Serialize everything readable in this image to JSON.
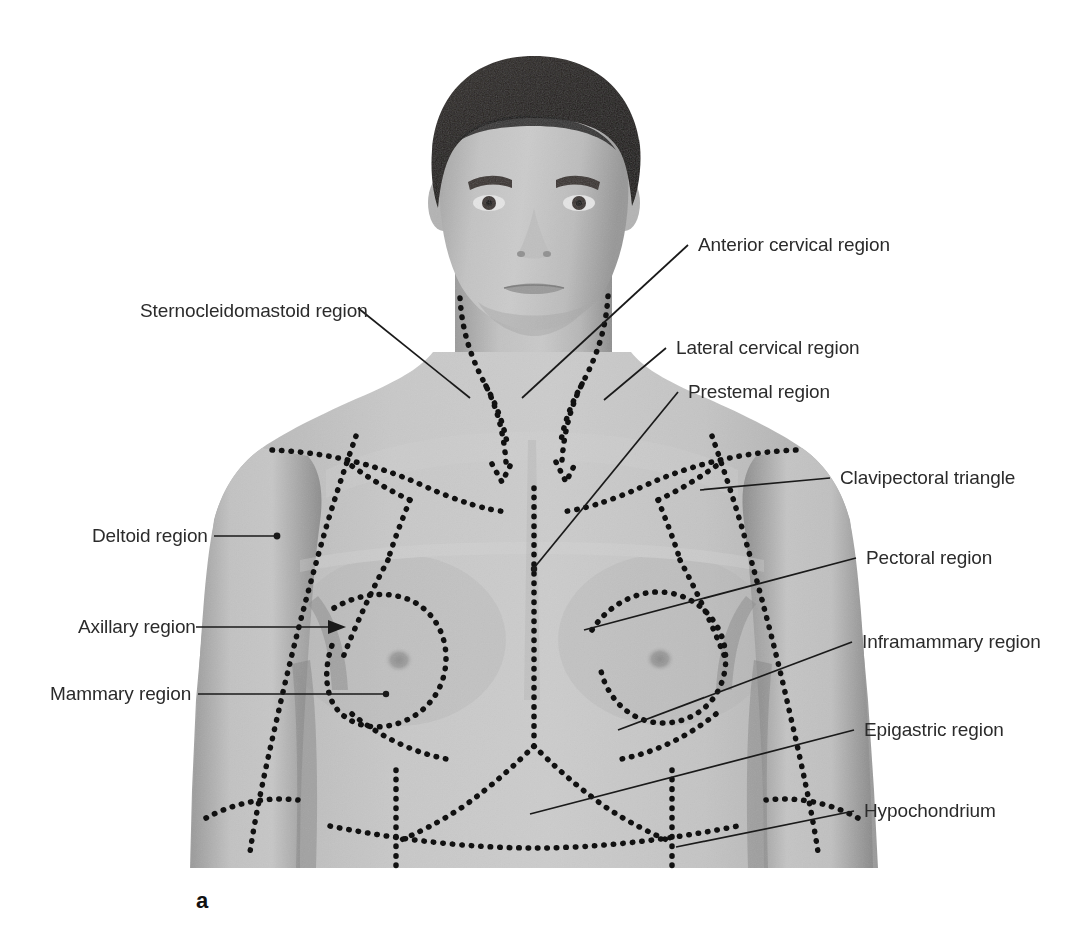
{
  "figure": {
    "panel_letter": "a",
    "caption_none": "",
    "view": "anterior thoracic regions",
    "background_color": "#ffffff",
    "label_color": "#2b2b2b",
    "leader_line_color": "#1a1a1a",
    "boundary_style": "dotted",
    "boundary_color": "#111111",
    "skin_tone_light": "#c9c9c9",
    "skin_tone_mid": "#b4b4b4",
    "skin_tone_shadow": "#8f8f8f",
    "hair_color": "#241f1d"
  },
  "labels": {
    "left": [
      {
        "id": "sternocleidomastoid-region",
        "text": "Sternocleidomastoid region",
        "x": 140,
        "y": 300,
        "terminator": "plain"
      },
      {
        "id": "deltoid-region",
        "text": "Deltoid region",
        "x": 92,
        "y": 530,
        "terminator": "dot"
      },
      {
        "id": "axillary-region",
        "text": "Axillary region",
        "x": 78,
        "y": 620,
        "terminator": "arrow"
      },
      {
        "id": "mammary-region",
        "text": "Mammary region",
        "x": 50,
        "y": 688,
        "terminator": "dot"
      }
    ],
    "right": [
      {
        "id": "anterior-cervical-region",
        "text": "Anterior cervical region",
        "x": 698,
        "y": 240,
        "terminator": "plain"
      },
      {
        "id": "lateral-cervical-region",
        "text": "Lateral cervical region",
        "x": 676,
        "y": 343,
        "terminator": "plain"
      },
      {
        "id": "prestemal-region",
        "text": "Prestemal region",
        "x": 688,
        "y": 387,
        "terminator": "plain"
      },
      {
        "id": "clavipectoral-triangle",
        "text": "Clavipectoral triangle",
        "x": 840,
        "y": 472,
        "terminator": "plain"
      },
      {
        "id": "pectoral-region",
        "text": "Pectoral region",
        "x": 866,
        "y": 552,
        "terminator": "plain"
      },
      {
        "id": "inframammary-region",
        "text": "Inframammary region",
        "x": 862,
        "y": 636,
        "terminator": "plain"
      },
      {
        "id": "epigastric-region",
        "text": "Epigastric region",
        "x": 864,
        "y": 724,
        "terminator": "plain"
      },
      {
        "id": "hypochondrium",
        "text": "Hypochondrium",
        "x": 864,
        "y": 805,
        "terminator": "plain"
      }
    ]
  },
  "regions_depicted": [
    "Sternocleidomastoid region",
    "Anterior cervical region",
    "Lateral cervical region",
    "Prestemal region",
    "Clavipectoral triangle",
    "Deltoid region",
    "Pectoral region",
    "Axillary region",
    "Mammary region",
    "Inframammary region",
    "Epigastric region",
    "Hypochondrium"
  ]
}
